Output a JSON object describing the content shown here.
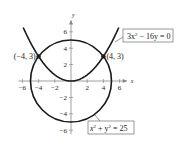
{
  "chart_data": {
    "type": "line",
    "title": "",
    "xlabel": "x",
    "ylabel": "y",
    "xlim": [
      -6.5,
      7
    ],
    "ylim": [
      -6.5,
      7.5
    ],
    "x_ticks": [
      -6,
      -4,
      -2,
      2,
      4,
      6
    ],
    "y_ticks": [
      6,
      4,
      2,
      -2,
      -4,
      -6
    ],
    "x_tick_labels": [
      "−6",
      "−4",
      "−2",
      "2",
      "4",
      "6"
    ],
    "y_tick_labels": [
      "6",
      "4",
      "2",
      "−2",
      "−4",
      "−6"
    ],
    "grid": false,
    "series": [
      {
        "name": "3x² − 16y = 0",
        "kind": "parabola",
        "equation": "y = 3x²/16",
        "x_range": [
          -5.9,
          5.9
        ]
      },
      {
        "name": "x² + y² = 25",
        "kind": "circle",
        "center": [
          0,
          0
        ],
        "radius": 5
      }
    ],
    "points": [
      {
        "label": "(−4, 3)",
        "x": -4,
        "y": 3
      },
      {
        "label": "(4, 3)",
        "x": 4,
        "y": 3
      }
    ],
    "annotations": [
      {
        "text_main": "3x",
        "sup": "2",
        "text_rest": " − 16y = 0",
        "target": "parabola"
      },
      {
        "text_main": "x",
        "sup": "2",
        "text_mid": " + y",
        "sup2": "2",
        "text_rest": " = 25",
        "target": "circle"
      }
    ]
  },
  "colors": {
    "curve": "#1a1a1a",
    "axis": "#888888",
    "text": "#222222",
    "box_border": "#555555"
  }
}
